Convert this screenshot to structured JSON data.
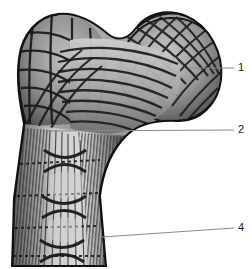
{
  "figure": {
    "background_color": "#ffffff",
    "ink_color": "#1a1a1a",
    "bone_tone_light": "#d2d2d2",
    "bone_tone_mid": "#8f8f8f",
    "bone_tone_dark": "#3a3a3a",
    "trabecula_color": "#241f1f",
    "leader_color": "#8a8a8a"
  },
  "callouts": [
    {
      "id": "callout-1",
      "number": "1",
      "target": "femoral-head",
      "label_x": 238,
      "label_y": 62,
      "line_from_x": 188,
      "line_from_y": 68,
      "line_to_x": 234,
      "line_to_y": 68
    },
    {
      "id": "callout-2",
      "number": "2",
      "target": "femoral-neck",
      "label_x": 238,
      "label_y": 124,
      "line_from_x": 48,
      "line_from_y": 131,
      "line_to_x": 234,
      "line_to_y": 130
    },
    {
      "id": "callout-4",
      "number": "4",
      "target": "femoral-shaft-cortex",
      "label_x": 238,
      "label_y": 222,
      "line_from_x": 88,
      "line_from_y": 238,
      "line_to_x": 234,
      "line_to_y": 228
    }
  ],
  "regions": [
    {
      "name": "greater-trochanter",
      "description": "coarse rectangular trabecular mesh, upper left lobe"
    },
    {
      "name": "femoral-head",
      "description": "rounded upper right lobe with dense crosshatch trabeculae"
    },
    {
      "name": "femoral-neck",
      "description": "arched compressive trabecular fan"
    },
    {
      "name": "femoral-shaft",
      "description": "vertical cortical striations with internal bow-tie struts"
    }
  ]
}
